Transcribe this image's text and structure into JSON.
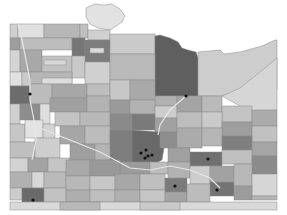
{
  "map": {
    "type": "choropleth",
    "region": "Minnesota counties",
    "color_scale": "grayscale",
    "shades": {
      "lightest": "#e4e4e4",
      "light": "#cfcfcf",
      "medium_light": "#bdbdbd",
      "medium": "#a8a8a8",
      "medium_dark": "#8f8f8f",
      "dark": "#747474",
      "darkest": "#5c5c5c"
    },
    "background": "#ffffff",
    "city_marker_color": "#111111",
    "city_markers": [
      {
        "x": 30,
        "y": 94
      },
      {
        "x": 186,
        "y": 96
      },
      {
        "x": 141,
        "y": 153
      },
      {
        "x": 146,
        "y": 150
      },
      {
        "x": 148,
        "y": 156
      },
      {
        "x": 152,
        "y": 155
      },
      {
        "x": 145,
        "y": 158
      },
      {
        "x": 208,
        "y": 159
      },
      {
        "x": 175,
        "y": 186
      },
      {
        "x": 217,
        "y": 190
      },
      {
        "x": 33,
        "y": 200
      }
    ]
  }
}
